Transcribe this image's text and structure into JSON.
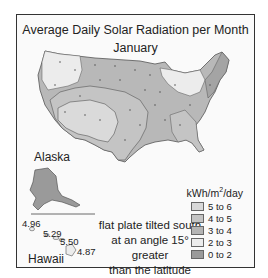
{
  "title": "Average Daily Solar Radiation per Month",
  "month": "January",
  "regions": {
    "alaska": "Alaska",
    "hawaii": "Hawaii"
  },
  "hawaii_values": [
    "4.96",
    "5.29",
    "5.50",
    "4.87"
  ],
  "note_lines": [
    "flat plate tilted south",
    "at an angle 15° greater",
    "than the latitude"
  ],
  "legend": {
    "unit_prefix": "kWh/m",
    "unit_sup": "2",
    "unit_suffix": "/day",
    "items": [
      {
        "label": "5 to 6",
        "color": "#d8d8d8"
      },
      {
        "label": "4 to 5",
        "color": "#c4c4c4"
      },
      {
        "label": "3 to 4",
        "color": "#b4b4b4"
      },
      {
        "label": "2 to 3",
        "color": "#ececec"
      },
      {
        "label": "0 to 2",
        "color": "#9a9a9a"
      }
    ]
  },
  "colors": {
    "zone_2_3": "#ececec",
    "zone_3_4": "#b4b4b4",
    "zone_4_5": "#c4c4c4",
    "zone_5_6": "#d8d8d8",
    "zone_0_2": "#9a9a9a",
    "border": "#555555"
  }
}
